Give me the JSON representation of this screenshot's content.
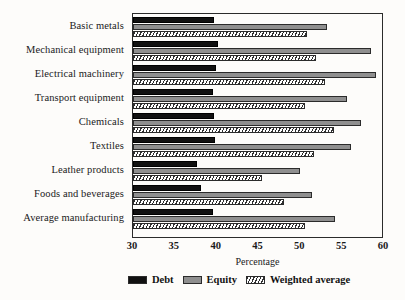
{
  "chart_data": {
    "type": "bar",
    "orientation": "horizontal",
    "title": "",
    "xlabel": "Percentage",
    "ylabel": "",
    "xlim": [
      30,
      60
    ],
    "xticks": [
      30,
      35,
      40,
      45,
      50,
      55,
      60
    ],
    "grid": false,
    "legend_position": "bottom",
    "categories": [
      "Basic metals",
      "Mechanical equipment",
      "Electrical machinery",
      "Transport equipment",
      "Chemicals",
      "Textiles",
      "Leather products",
      "Foods and beverages",
      "Average manufacturing"
    ],
    "series": [
      {
        "name": "Debt",
        "color": "#111111",
        "pattern": "solid",
        "values": [
          39.7,
          40.1,
          39.9,
          39.6,
          39.7,
          39.8,
          37.7,
          38.1,
          39.6
        ]
      },
      {
        "name": "Equity",
        "color": "#8f8f8f",
        "pattern": "solid",
        "values": [
          53.2,
          58.4,
          59.1,
          55.6,
          57.2,
          56.0,
          50.0,
          51.4,
          54.1
        ]
      },
      {
        "name": "Weighted average",
        "color": "#2f2f2f",
        "pattern": "diagonal-hatch",
        "values": [
          50.8,
          51.9,
          53.0,
          50.5,
          54.0,
          51.6,
          45.4,
          48.0,
          50.5
        ]
      }
    ]
  },
  "legend": {
    "entries": [
      {
        "label": "Debt",
        "swatch": "solid-black-swatch"
      },
      {
        "label": "Equity",
        "swatch": "solid-gray-swatch"
      },
      {
        "label": "Weighted average",
        "swatch": "hatched-swatch"
      }
    ]
  }
}
